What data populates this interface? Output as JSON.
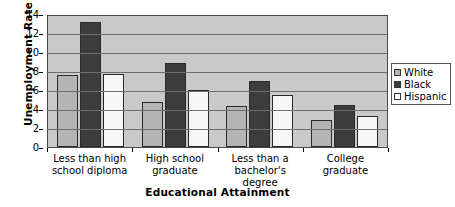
{
  "chart_data": {
    "type": "bar",
    "title": "",
    "xlabel": "Educational Attainment",
    "ylabel": "Unemployment Rate",
    "ylim": [
      0,
      14
    ],
    "yticks": [
      0,
      2,
      4,
      6,
      8,
      10,
      12,
      14
    ],
    "grid": true,
    "legend_position": "right",
    "categories": [
      "Less than high school diploma",
      "High school graduate",
      "Less than a bachelor's degree",
      "College graduate"
    ],
    "series": [
      {
        "name": "White",
        "color": "#b4b4b4",
        "values": [
          7.6,
          4.7,
          4.3,
          2.8
        ]
      },
      {
        "name": "Black",
        "color": "#3c3c3c",
        "values": [
          13.2,
          8.8,
          6.9,
          4.4
        ]
      },
      {
        "name": "Hispanic",
        "color": "#f7f7f7",
        "values": [
          7.7,
          6.0,
          5.5,
          3.3
        ]
      }
    ]
  },
  "axes": {
    "y_title": "Unemployment Rate",
    "x_title": "Educational Attainment",
    "y_tick_labels": [
      "14",
      "12",
      "10",
      "8",
      "6",
      "4",
      "2",
      "0"
    ]
  },
  "legend": {
    "items": [
      {
        "label": "White"
      },
      {
        "label": "Black"
      },
      {
        "label": "Hispanic"
      }
    ]
  },
  "colors": {
    "plot_background": "#c9c9c9",
    "gridline": "#6e6e6e",
    "frame": "#4a4a4a",
    "series_white": "#b4b4b4",
    "series_black": "#3c3c3c",
    "series_hispanic": "#f7f7f7"
  }
}
